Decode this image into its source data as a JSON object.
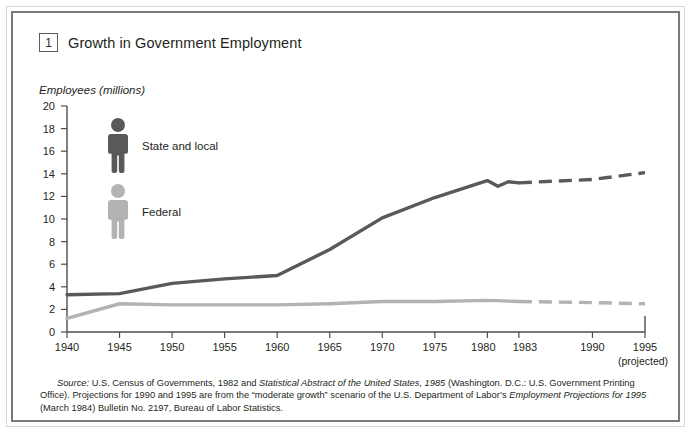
{
  "figure": {
    "number": "1",
    "title": "Growth in Government Employment",
    "y_axis_caption": "Employees (millions)"
  },
  "legend": {
    "items": [
      {
        "label": "State and local",
        "color": "#58595b",
        "icon": "person-icon"
      },
      {
        "label": "Federal",
        "color": "#b3b3b3",
        "icon": "person-icon"
      }
    ]
  },
  "axis": {
    "projected_note": "(projected)",
    "y_ticks": [
      "0",
      "2",
      "4",
      "6",
      "8",
      "10",
      "12",
      "14",
      "16",
      "18",
      "20"
    ],
    "x_ticks": [
      "1940",
      "1945",
      "1950",
      "1955",
      "1960",
      "1965",
      "1970",
      "1975",
      "1980",
      "1983",
      "1990",
      "1995"
    ]
  },
  "source": {
    "label": "Source:",
    "line1_a": " U.S. Census of Governments, 1982 and ",
    "line1_italic": "Statistical Abstract of the United States, 1985",
    "line1_b": " (Washington. D.C.: U.S. Government Printing Office).",
    "line2_a": "Projections for 1990 and 1995 are from the “moderate growth” scenario of the U.S. Department of Labor’s ",
    "line2_italic": "Employment Projections for 1995",
    "line2_b": " (March",
    "line3": "1984) Bulletin No. 2197, Bureau of Labor Statistics."
  },
  "chart_data": {
    "type": "line",
    "title": "Growth in Government Employment",
    "xlabel": "",
    "ylabel": "Employees (millions)",
    "xlim": [
      1940,
      1995
    ],
    "ylim": [
      0,
      20
    ],
    "ytick_step": 2,
    "grid": false,
    "legend_position": "inside-upper-left",
    "projection_starts": 1983,
    "series": [
      {
        "name": "State and local",
        "color": "#58595b",
        "x": [
          1940,
          1945,
          1950,
          1955,
          1960,
          1965,
          1970,
          1975,
          1978,
          1980,
          1981,
          1982,
          1983,
          1990,
          1995
        ],
        "values": [
          3.3,
          3.4,
          4.3,
          4.7,
          5.0,
          7.3,
          10.1,
          11.9,
          12.8,
          13.4,
          12.9,
          13.3,
          13.2,
          13.5,
          14.1
        ],
        "solid_through": 1983,
        "dashed_from": 1983
      },
      {
        "name": "Federal",
        "color": "#b3b3b3",
        "x": [
          1940,
          1945,
          1950,
          1955,
          1960,
          1965,
          1970,
          1975,
          1980,
          1983,
          1990,
          1995
        ],
        "values": [
          1.2,
          2.5,
          2.4,
          2.4,
          2.4,
          2.5,
          2.7,
          2.7,
          2.8,
          2.7,
          2.6,
          2.5
        ],
        "solid_through": 1983,
        "dashed_from": 1983
      }
    ]
  }
}
